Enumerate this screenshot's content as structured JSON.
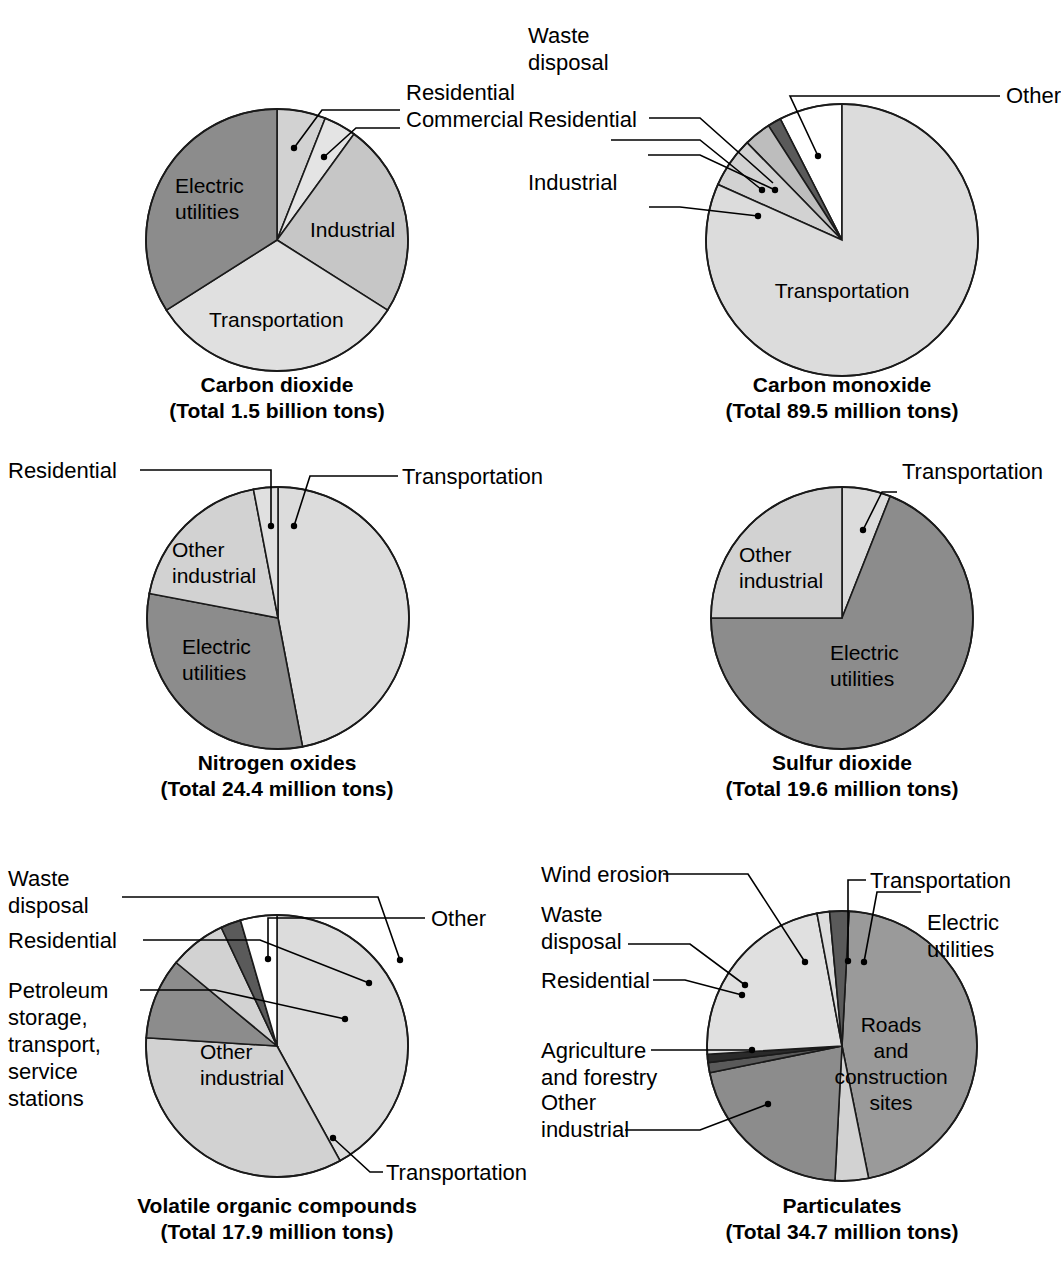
{
  "figure": {
    "background": "#ffffff",
    "palette": {
      "white": "#ffffff",
      "very_light_gray": "#e4e4e4",
      "light_gray": "#d2d2d2",
      "medium_gray": "#bdbdbd",
      "dark_gray": "#8c8c8c",
      "darkest_gray": "#5a5a5a",
      "outline": "#1a1a1a"
    }
  },
  "chart_data": [
    {
      "id": "carbon-dioxide",
      "type": "pie",
      "title": "Carbon dioxide",
      "subtitle": "(Total 1.5 billion tons)",
      "total_label": "Total 1.5 billion tons",
      "categories": [
        "Residential",
        "Commercial",
        "Industrial",
        "Transportation",
        "Electric utilities"
      ],
      "values": [
        6,
        4,
        24,
        32,
        34
      ],
      "colors": [
        "#d2d2d2",
        "#e4e4e4",
        "#c6c6c6",
        "#e0e0e0",
        "#8c8c8c"
      ],
      "labels_inside": [
        "Industrial",
        "Transportation",
        "Electric utilities"
      ],
      "labels_leader": [
        "Residential",
        "Commercial"
      ]
    },
    {
      "id": "carbon-monoxide",
      "type": "pie",
      "title": "Carbon monoxide",
      "subtitle": "(Total 89.5 million tons)",
      "total_label": "Total 89.5 million tons",
      "categories": [
        "Other",
        "Waste disposal",
        "Residential",
        "Industrial",
        "Transportation"
      ],
      "values": [
        7.5,
        1.6,
        3.2,
        6.0,
        81.7
      ],
      "colors": [
        "#ffffff",
        "#5a5a5a",
        "#bdbdbd",
        "#d2d2d2",
        "#dcdcdc"
      ],
      "labels_inside": [
        "Transportation"
      ],
      "labels_leader": [
        "Waste disposal",
        "Residential",
        "Industrial",
        "Other"
      ]
    },
    {
      "id": "nitrogen-oxides",
      "type": "pie",
      "title": "Nitrogen oxides",
      "subtitle": "(Total 24.4 million tons)",
      "total_label": "Total 24.4 million tons",
      "categories": [
        "Transportation",
        "Electric utilities",
        "Other industrial",
        "Residential"
      ],
      "values": [
        47,
        31,
        19,
        3
      ],
      "colors": [
        "#dcdcdc",
        "#8c8c8c",
        "#d2d2d2",
        "#e0e0e0"
      ],
      "labels_inside": [
        "Other industrial",
        "Electric utilities"
      ],
      "labels_leader": [
        "Residential",
        "Transportation"
      ]
    },
    {
      "id": "sulfur-dioxide",
      "type": "pie",
      "title": "Sulfur dioxide",
      "subtitle": "(Total 19.6 million tons)",
      "total_label": "Total 19.6 million tons",
      "categories": [
        "Transportation",
        "Electric utilities",
        "Other industrial"
      ],
      "values": [
        6,
        69,
        25
      ],
      "colors": [
        "#dcdcdc",
        "#8c8c8c",
        "#d2d2d2"
      ],
      "labels_inside": [
        "Other industrial",
        "Electric utilities"
      ],
      "labels_leader": [
        "Transportation"
      ]
    },
    {
      "id": "volatile-organic-compounds",
      "type": "pie",
      "title": "Volatile organic compounds",
      "subtitle": "(Total 17.9 million tons)",
      "total_label": "Total 17.9 million tons",
      "categories": [
        "Transportation",
        "Other industrial",
        "Petroleum storage, transport, service stations",
        "Residential",
        "Waste disposal",
        "Other"
      ],
      "values": [
        42,
        34,
        10,
        7,
        2.5,
        4.5
      ],
      "colors": [
        "#dcdcdc",
        "#d2d2d2",
        "#8c8c8c",
        "#d2d2d2",
        "#5a5a5a",
        "#ffffff"
      ],
      "labels_inside": [
        "Other industrial"
      ],
      "labels_leader": [
        "Waste disposal",
        "Residential",
        "Petroleum storage, transport, service stations",
        "Other",
        "Transportation"
      ]
    },
    {
      "id": "particulates",
      "type": "pie",
      "title": "Particulates",
      "subtitle": "(Total 34.7 million tons)",
      "total_label": "Total 34.7 million tons",
      "categories": [
        "Roads and construction sites",
        "Other industrial",
        "Agriculture and forestry",
        "Residential",
        "Waste disposal",
        "Wind erosion",
        "Transportation",
        "Electric utilities"
      ],
      "values": [
        46,
        4,
        21,
        1.2,
        1.0,
        23,
        1.5,
        2.3
      ],
      "colors": [
        "#9a9a9a",
        "#d2d2d2",
        "#8c8c8c",
        "#5a5a5a",
        "#2a2a2a",
        "#e0e0e0",
        "#dcdcdc",
        "#5a5a5a"
      ],
      "labels_inside": [
        "Roads and construction sites"
      ],
      "labels_leader": [
        "Wind erosion",
        "Waste disposal",
        "Residential",
        "Agriculture and forestry",
        "Other industrial",
        "Transportation",
        "Electric utilities"
      ]
    }
  ],
  "panels": {
    "co2": {
      "title": "Carbon dioxide",
      "subtitle": "(Total 1.5 billion tons)",
      "residential": "Residential",
      "commercial": "Commercial",
      "industrial": "Industrial",
      "transportation": "Transportation",
      "electric_1": "Electric",
      "electric_2": "utilities"
    },
    "co": {
      "title": "Carbon monoxide",
      "subtitle": "(Total 89.5 million tons)",
      "waste_1": "Waste",
      "waste_2": "disposal",
      "residential": "Residential",
      "industrial": "Industrial",
      "other": "Other",
      "transportation": "Transportation"
    },
    "nox": {
      "title": "Nitrogen oxides",
      "subtitle": "(Total 24.4 million tons)",
      "residential": "Residential",
      "transportation": "Transportation",
      "other_1": "Other",
      "other_2": "industrial",
      "electric_1": "Electric",
      "electric_2": "utilities"
    },
    "so2": {
      "title": "Sulfur dioxide",
      "subtitle": "(Total 19.6 million tons)",
      "transportation": "Transportation",
      "other_1": "Other",
      "other_2": "industrial",
      "electric_1": "Electric",
      "electric_2": "utilities"
    },
    "voc": {
      "title": "Volatile organic compounds",
      "subtitle": "(Total 17.9 million tons)",
      "waste_1": "Waste",
      "waste_2": "disposal",
      "residential": "Residential",
      "petro_1": "Petroleum",
      "petro_2": "storage,",
      "petro_3": "transport,",
      "petro_4": "service",
      "petro_5": "stations",
      "other_1": "Other",
      "other_2": "industrial",
      "other": "Other",
      "transportation": "Transportation"
    },
    "part": {
      "title": "Particulates",
      "subtitle": "(Total 34.7 million tons)",
      "wind": "Wind erosion",
      "waste_1": "Waste",
      "waste_2": "disposal",
      "residential": "Residential",
      "agri_1": "Agriculture",
      "agri_2": "and forestry",
      "otherind_1": "Other",
      "otherind_2": "industrial",
      "transportation": "Transportation",
      "electric_1": "Electric",
      "electric_2": "utilities",
      "roads_1": "Roads",
      "roads_2": "and",
      "roads_3": "construction",
      "roads_4": "sites"
    }
  }
}
